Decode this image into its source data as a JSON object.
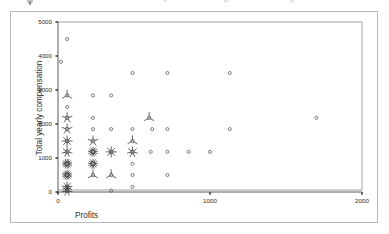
{
  "figure": {
    "type": "sunflower-scatter-plot",
    "background": "#ffffff",
    "frame_color": "#b9b9b9",
    "axis_color": "#4a4a4a",
    "marker_color": "#555555"
  },
  "axes": {
    "x_title": "Profits",
    "y_title": "Total yearly compensation",
    "x_ticks": [
      "0",
      "1000",
      "2000"
    ],
    "y_ticks": [
      "0",
      "1000",
      "2000",
      "3000",
      "4000",
      "5000"
    ]
  },
  "chart_data": {
    "type": "scatter",
    "title": "",
    "subtitle": "",
    "xlabel": "Profits",
    "ylabel": "Total yearly compensation",
    "xlim": [
      0,
      2000
    ],
    "ylim": [
      0,
      5000
    ],
    "xticks": [
      0,
      1000,
      2000
    ],
    "yticks": [
      0,
      1000,
      2000,
      3000,
      4000,
      5000
    ],
    "grid": false,
    "legend": null,
    "marker_style": "sunflower",
    "marker_note": "Each symbol is a sunflower: an open circle plus one short radiating petal per observation at that coordinate; single observations are drawn as a plain open circle.",
    "points": [
      {
        "x": 60,
        "y": 4500,
        "count": 1
      },
      {
        "x": 20,
        "y": 3830,
        "count": 1
      },
      {
        "x": 490,
        "y": 3500,
        "count": 1
      },
      {
        "x": 720,
        "y": 3500,
        "count": 1
      },
      {
        "x": 1130,
        "y": 3500,
        "count": 1
      },
      {
        "x": 60,
        "y": 2840,
        "count": 3
      },
      {
        "x": 230,
        "y": 2840,
        "count": 1
      },
      {
        "x": 350,
        "y": 2840,
        "count": 1
      },
      {
        "x": 60,
        "y": 2500,
        "count": 1
      },
      {
        "x": 60,
        "y": 2180,
        "count": 5
      },
      {
        "x": 230,
        "y": 2180,
        "count": 1
      },
      {
        "x": 600,
        "y": 2180,
        "count": 3
      },
      {
        "x": 1700,
        "y": 2180,
        "count": 1
      },
      {
        "x": 60,
        "y": 1850,
        "count": 5
      },
      {
        "x": 230,
        "y": 1850,
        "count": 1
      },
      {
        "x": 350,
        "y": 1850,
        "count": 1
      },
      {
        "x": 490,
        "y": 1850,
        "count": 1
      },
      {
        "x": 620,
        "y": 1850,
        "count": 1
      },
      {
        "x": 720,
        "y": 1850,
        "count": 1
      },
      {
        "x": 1130,
        "y": 1850,
        "count": 1
      },
      {
        "x": 60,
        "y": 1500,
        "count": 8
      },
      {
        "x": 230,
        "y": 1500,
        "count": 5
      },
      {
        "x": 490,
        "y": 1500,
        "count": 3
      },
      {
        "x": 60,
        "y": 1180,
        "count": 7
      },
      {
        "x": 230,
        "y": 1180,
        "count": 13
      },
      {
        "x": 350,
        "y": 1180,
        "count": 8
      },
      {
        "x": 490,
        "y": 1180,
        "count": 7
      },
      {
        "x": 610,
        "y": 1180,
        "count": 1
      },
      {
        "x": 720,
        "y": 1180,
        "count": 1
      },
      {
        "x": 860,
        "y": 1180,
        "count": 1
      },
      {
        "x": 1000,
        "y": 1180,
        "count": 1
      },
      {
        "x": 60,
        "y": 830,
        "count": 16
      },
      {
        "x": 230,
        "y": 830,
        "count": 13
      },
      {
        "x": 490,
        "y": 830,
        "count": 1
      },
      {
        "x": 60,
        "y": 500,
        "count": 16
      },
      {
        "x": 230,
        "y": 500,
        "count": 3
      },
      {
        "x": 350,
        "y": 500,
        "count": 3
      },
      {
        "x": 490,
        "y": 500,
        "count": 1
      },
      {
        "x": 720,
        "y": 500,
        "count": 1
      },
      {
        "x": 60,
        "y": 150,
        "count": 9
      },
      {
        "x": 490,
        "y": 150,
        "count": 1
      },
      {
        "x": 60,
        "y": 40,
        "count": 7
      },
      {
        "x": 350,
        "y": 40,
        "count": 1
      }
    ]
  }
}
